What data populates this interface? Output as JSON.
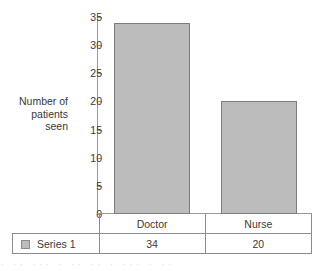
{
  "chart_data": {
    "type": "bar",
    "title": "",
    "xlabel": "",
    "ylabel": "Number of\npatients\nseen",
    "categories": [
      "Doctor",
      "Nurse"
    ],
    "values": [
      34,
      20
    ],
    "series": [
      {
        "name": "Series 1",
        "values": [
          34,
          20
        ]
      }
    ],
    "ylim": [
      0,
      35
    ],
    "ytick_labels": [
      "35",
      "30",
      "25",
      "20",
      "15",
      "10",
      "5",
      "0"
    ],
    "ytick_values": [
      35,
      30,
      25,
      20,
      15,
      10,
      5,
      0
    ],
    "grid": false,
    "legend_position": "table-row",
    "bar_fill_color": "#bcbcbc",
    "bar_border_color": "#7d7d7d",
    "axis_color": "#9a9a9a"
  },
  "table": {
    "corner_label": "",
    "column_headers": [
      "Doctor",
      "Nurse"
    ],
    "series_label": "Series 1",
    "row_values": [
      "34",
      "20"
    ]
  },
  "artifact": {
    "text": "· ·· ··· · ·· ·· · ··· · ··"
  }
}
